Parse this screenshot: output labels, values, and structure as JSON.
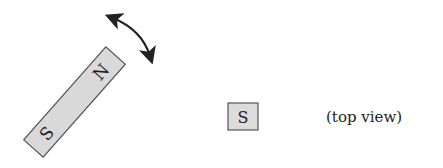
{
  "diagram": {
    "magnet": {
      "north_label": "N",
      "south_label": "S",
      "fill": "#d9d9d9",
      "stroke": "#555555"
    },
    "rotation_arrow": {
      "direction": "bidirectional"
    },
    "top_view_pole": {
      "label": "S",
      "fill": "#dcdcdc"
    },
    "caption": "(top view)"
  }
}
